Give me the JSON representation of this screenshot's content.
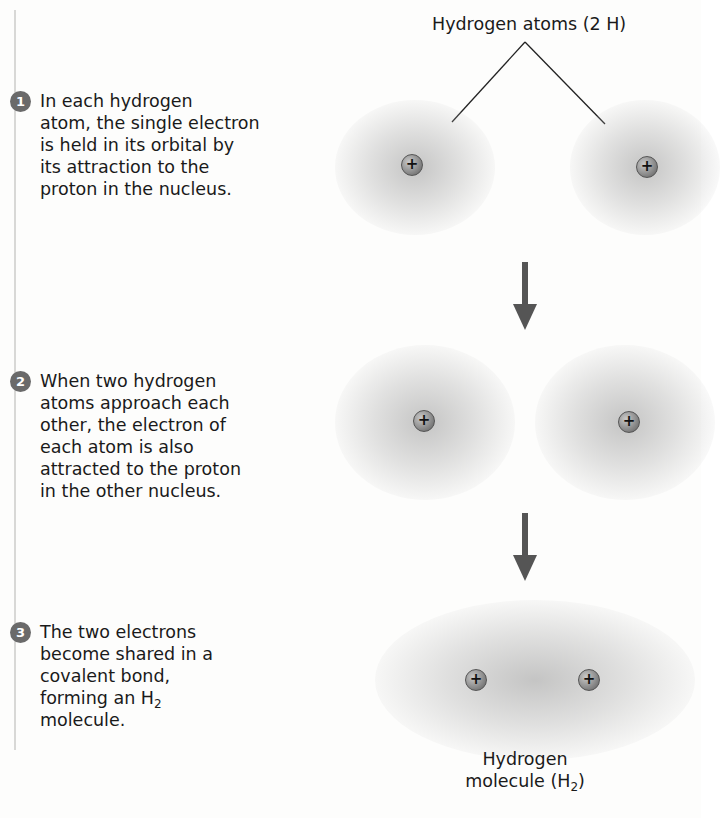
{
  "header": {
    "title": "Hydrogen atoms (2 H)"
  },
  "steps": [
    {
      "number": "1",
      "text": "In each hydrogen\natom, the single electron\nis held in its orbital by\nits attraction to the\nproton in the nucleus."
    },
    {
      "number": "2",
      "text": "When two hydrogen\natoms approach each\nother, the electron of\neach atom is also\nattracted to the proton\nin the other nucleus."
    },
    {
      "number": "3",
      "text_before": "The two electrons\nbecome shared in a\ncovalent bond,\nforming an H",
      "subscript": "2",
      "text_after": "\nmolecule."
    }
  ],
  "nucleus_symbol": "+",
  "molecule_label": {
    "line1": "Hydrogen",
    "line2_before": "molecule (H",
    "subscript": "2",
    "line2_after": ")"
  },
  "colors": {
    "text": "#1a1a1a",
    "step_badge": "#6a6a6a",
    "arrow": "#555555",
    "cloud": "#9a9a9a"
  }
}
